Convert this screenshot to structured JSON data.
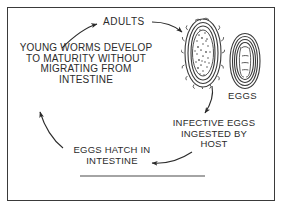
{
  "figure": {
    "background_color": "#ffffff",
    "border_color": "#3a3a3a",
    "ink_color": "#2b2b2b"
  },
  "labels": {
    "adults": "ADULTS",
    "young_worms": "YOUNG WORMS DEVELOP\nTO MATURITY WITHOUT\nMIGRATING FROM\nINTESTINE",
    "eggs": "EGGS",
    "infective_eggs": "INFECTIVE EGGS\nINGESTED BY\nHOST",
    "eggs_hatch": "EGGS HATCH IN\nINTESTINE"
  },
  "illustrations": [
    {
      "name": "fertilized-egg",
      "description": "Oval egg with thick mammillated outer shell and granular internal contents"
    },
    {
      "name": "infective-egg",
      "description": "Smaller oval egg with smooth layered shell containing a coiled larva"
    }
  ],
  "arrows": [
    {
      "name": "arrow-young-worms-to-adults",
      "from": "YOUNG WORMS DEVELOP TO MATURITY WITHOUT MIGRATING FROM INTESTINE",
      "to": "ADULTS",
      "direction": "up-right"
    },
    {
      "name": "arrow-adults-to-eggs",
      "from": "ADULTS",
      "to": "EGGS",
      "direction": "right-down"
    },
    {
      "name": "arrow-eggs-to-infective-eggs",
      "from": "EGGS",
      "to": "INFECTIVE EGGS INGESTED BY HOST",
      "direction": "down"
    },
    {
      "name": "arrow-infective-eggs-to-hatch",
      "from": "INFECTIVE EGGS INGESTED BY HOST",
      "to": "EGGS HATCH IN INTESTINE",
      "direction": "left"
    },
    {
      "name": "arrow-hatch-to-young-worms",
      "from": "EGGS HATCH IN INTESTINE",
      "to": "YOUNG WORMS DEVELOP TO MATURITY WITHOUT MIGRATING FROM INTESTINE",
      "direction": "up-left"
    }
  ],
  "rule": {
    "name": "bottom-rule",
    "description": "Horizontal line near bottom of frame"
  }
}
